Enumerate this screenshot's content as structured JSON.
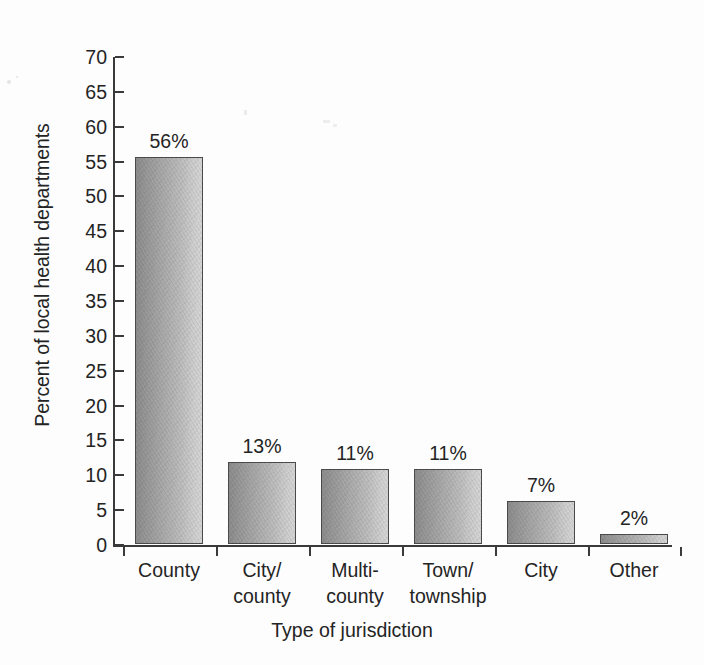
{
  "chart_data": {
    "type": "bar",
    "title": "",
    "xlabel": "Type of jurisdiction",
    "ylabel": "Percent of local health departments",
    "categories": [
      "County",
      "City/\ncounty",
      "Multi-\ncounty",
      "Town/\ntownship",
      "City",
      "Other"
    ],
    "values": [
      56,
      13,
      11,
      11,
      7,
      2
    ],
    "bar_labels": [
      "56%",
      "13%",
      "11%",
      "11%",
      "7%",
      "2%"
    ],
    "plotted_values": [
      55.5,
      11.7,
      10.8,
      10.8,
      6.2,
      1.4
    ],
    "ylim": [
      0,
      70
    ],
    "ytick_labels": [
      "70",
      "65",
      "60",
      "55",
      "50",
      "45",
      "40",
      "35",
      "30",
      "25",
      "20",
      "15",
      "10",
      "5",
      "0"
    ],
    "ytick_values": [
      70,
      65,
      60,
      55,
      50,
      45,
      40,
      35,
      30,
      25,
      20,
      15,
      10,
      5,
      0
    ],
    "grid": false,
    "legend": false,
    "legend_position": "none",
    "series": [
      {
        "name": "Percent of local health departments",
        "values": [
          56,
          13,
          11,
          11,
          7,
          2
        ]
      }
    ],
    "colors": {
      "bar_gradient_start": "#8d8d8d",
      "bar_gradient_end": "#d6d6d6",
      "bar_outline": "#4a4a4a",
      "axis": "#3a3a3a",
      "text": "#242424",
      "background": "#fdfdfd"
    }
  }
}
